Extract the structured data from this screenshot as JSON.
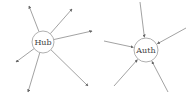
{
  "diagram": {
    "colors": {
      "edge": "#8a8a8a",
      "node_stroke": "#b0b0b0",
      "node_fill": "#ffffff",
      "text": "#444444"
    },
    "nodes": [
      {
        "id": "hub",
        "label": "Hub",
        "cx": 43,
        "cy": 42,
        "r": 11
      },
      {
        "id": "auth",
        "label": "Auth",
        "cx": 146,
        "cy": 50,
        "r": 12
      }
    ],
    "hub_edges_out": [
      {
        "x": 29,
        "y": 6
      },
      {
        "x": 72,
        "y": 9
      },
      {
        "x": 92,
        "y": 31
      },
      {
        "x": 16,
        "y": 62
      },
      {
        "x": 28,
        "y": 92
      },
      {
        "x": 88,
        "y": 86
      }
    ],
    "auth_edges_in": [
      {
        "x": 140,
        "y": 2
      },
      {
        "x": 186,
        "y": 28
      },
      {
        "x": 104,
        "y": 41
      },
      {
        "x": 114,
        "y": 86
      },
      {
        "x": 168,
        "y": 92
      }
    ]
  }
}
